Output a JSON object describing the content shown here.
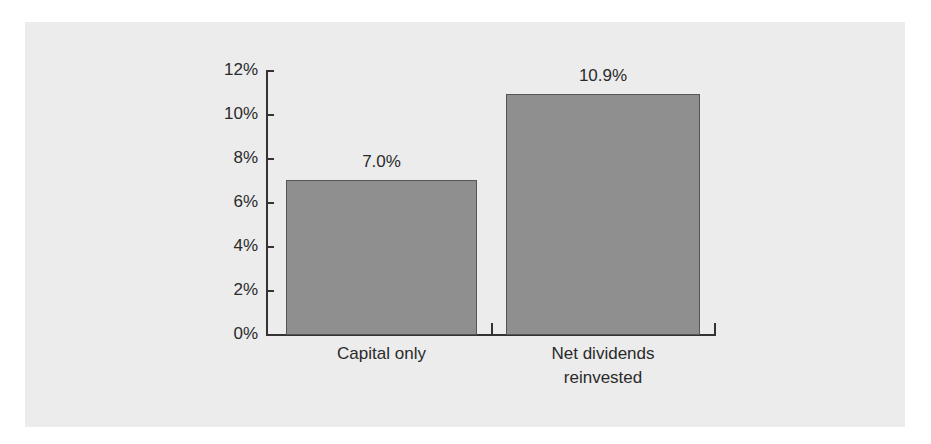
{
  "chart_data": {
    "type": "bar",
    "title": "",
    "xlabel": "",
    "ylabel": "",
    "categories": [
      "Capital only",
      "Net dividends reinvested"
    ],
    "category_lines": [
      [
        "Capital only"
      ],
      [
        "Net dividends",
        "reinvested"
      ]
    ],
    "values": [
      7.0,
      10.9
    ],
    "value_labels": [
      "7.0%",
      "10.9%"
    ],
    "ylim": [
      0,
      12
    ],
    "yticks": [
      0,
      2,
      4,
      6,
      8,
      10,
      12
    ],
    "ytick_labels": [
      "0%",
      "2%",
      "4%",
      "6%",
      "8%",
      "10%",
      "12%"
    ],
    "grid": false,
    "legend": null,
    "bar_color": "#8f8f8f",
    "background_color": "#ececec"
  }
}
